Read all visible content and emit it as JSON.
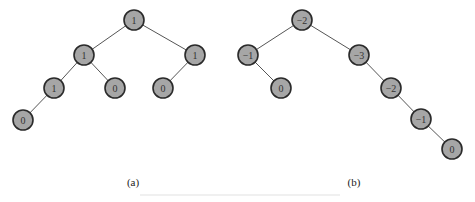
{
  "trees": [
    {
      "label": "(a)",
      "label_pos": [
        133,
        183
      ],
      "nodes": [
        {
          "id": "a0",
          "value": "1",
          "x": 134,
          "y": 20
        },
        {
          "id": "a1",
          "value": "1",
          "x": 84,
          "y": 55
        },
        {
          "id": "a2",
          "value": "1",
          "x": 195,
          "y": 55
        },
        {
          "id": "a3",
          "value": "1",
          "x": 54,
          "y": 88
        },
        {
          "id": "a4",
          "value": "0",
          "x": 115,
          "y": 88
        },
        {
          "id": "a5",
          "value": "0",
          "x": 163,
          "y": 88
        },
        {
          "id": "a6",
          "value": "0",
          "x": 23,
          "y": 120
        }
      ],
      "edges": [
        [
          "a0",
          "a1"
        ],
        [
          "a0",
          "a2"
        ],
        [
          "a1",
          "a3"
        ],
        [
          "a1",
          "a4"
        ],
        [
          "a2",
          "a5"
        ],
        [
          "a3",
          "a6"
        ]
      ]
    },
    {
      "label": "(b)",
      "label_pos": [
        354,
        183
      ],
      "nodes": [
        {
          "id": "b0",
          "value": "−2",
          "x": 302,
          "y": 20
        },
        {
          "id": "b1",
          "value": "−1",
          "x": 248,
          "y": 55
        },
        {
          "id": "b2",
          "value": "−3",
          "x": 359,
          "y": 55
        },
        {
          "id": "b3",
          "value": "0",
          "x": 281,
          "y": 88
        },
        {
          "id": "b4",
          "value": "−2",
          "x": 391,
          "y": 88
        },
        {
          "id": "b5",
          "value": "−1",
          "x": 421,
          "y": 119
        },
        {
          "id": "b6",
          "value": "0",
          "x": 452,
          "y": 149
        }
      ],
      "edges": [
        [
          "b0",
          "b1"
        ],
        [
          "b0",
          "b2"
        ],
        [
          "b1",
          "b3"
        ],
        [
          "b2",
          "b4"
        ],
        [
          "b4",
          "b5"
        ],
        [
          "b5",
          "b6"
        ]
      ]
    }
  ],
  "captions": {
    "a": "(a)",
    "b": "(b)"
  }
}
